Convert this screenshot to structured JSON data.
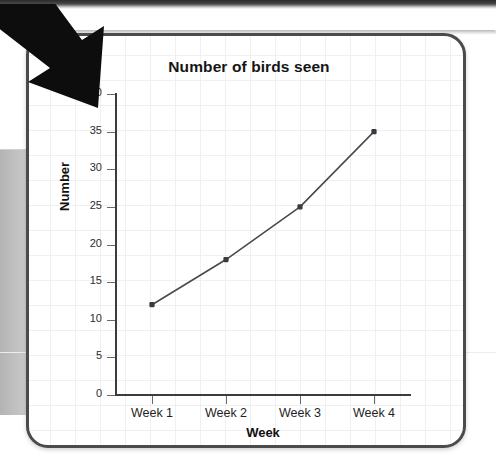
{
  "page": {
    "background_color": "#ffffff",
    "card_border_color": "#4b4b4b",
    "grid_color": "#f0f0f0"
  },
  "decoration": {
    "arrow_name": "pointer-arrow-icon",
    "arrow_color": "#0d0d0d"
  },
  "chart_data": {
    "type": "line",
    "title": "Number of birds seen",
    "xlabel": "Week",
    "ylabel": "Number",
    "categories": [
      "Week 1",
      "Week 2",
      "Week 3",
      "Week 4"
    ],
    "values": [
      12,
      18,
      25,
      35
    ],
    "ylim": [
      0,
      40
    ],
    "ytick_values": [
      0,
      5,
      10,
      15,
      20,
      25,
      30,
      35,
      40
    ],
    "ytick_labels": [
      "0",
      "5",
      "10",
      "15",
      "20",
      "25",
      "30",
      "35",
      "40"
    ],
    "grid": true,
    "legend": null,
    "line_color": "#4a4a52",
    "marker_color": "#3a3a42",
    "marker_shape": "square",
    "series": [
      {
        "name": "Number of birds seen",
        "points": [
          {
            "x": "Week 1",
            "y": 12
          },
          {
            "x": "Week 2",
            "y": 18
          },
          {
            "x": "Week 3",
            "y": 25
          },
          {
            "x": "Week 4",
            "y": 35
          }
        ]
      }
    ]
  }
}
